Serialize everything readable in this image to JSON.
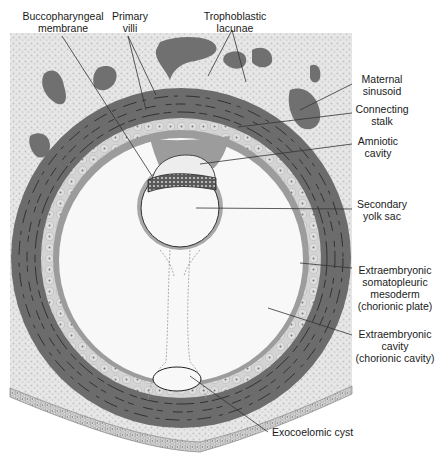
{
  "figure": {
    "colors": {
      "background": "#ffffff",
      "endometrial_stroma": "#e4e4e4",
      "stroma_dots": "#bdbdbd",
      "syncytiotrophoblast": "#6e6e6e",
      "lacunae": "#8a8a8a",
      "cytotrophoblast": "#d2d2d2",
      "mesoderm": "#9a9a9a",
      "cavity": "#f7f7f7",
      "outline": "#222222",
      "leader_line": "#333333"
    }
  },
  "labels": {
    "buccopharyngeal": [
      "Buccopharyngeal",
      "membrane"
    ],
    "primary_villi": [
      "Primary",
      "villi"
    ],
    "trophoblastic_lacunae": [
      "Trophoblastic",
      "lacunae"
    ],
    "maternal_sinusoid": [
      "Maternal",
      "sinusoid"
    ],
    "connecting_stalk": [
      "Connecting",
      "stalk"
    ],
    "amniotic_cavity": [
      "Amniotic",
      "cavity"
    ],
    "secondary_yolk_sac": [
      "Secondary",
      "yolk sac"
    ],
    "chorionic_plate": [
      "Extraembryonic",
      "somatopleuric",
      "mesoderm",
      "(chorionic plate)"
    ],
    "chorionic_cavity": [
      "Extraembryonic",
      "cavity",
      "(chorionic cavity)"
    ],
    "exocoelomic_cyst": [
      "Exocoelomic cyst"
    ]
  }
}
